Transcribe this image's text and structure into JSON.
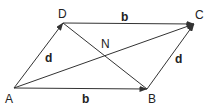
{
  "diagram": {
    "type": "parallelogram-vectors",
    "vertices": {
      "A": {
        "label": "A",
        "x": 14,
        "y": 88
      },
      "B": {
        "label": "B",
        "x": 147,
        "y": 89
      },
      "C": {
        "label": "C",
        "x": 194,
        "y": 24
      },
      "D": {
        "label": "D",
        "x": 63,
        "y": 23
      }
    },
    "intersection": {
      "label": "N"
    },
    "vectors": {
      "AB": {
        "label": "b"
      },
      "DC": {
        "label": "b"
      },
      "AD": {
        "label": "d"
      },
      "BC": {
        "label": "d"
      }
    },
    "diagonals": [
      "AC",
      "DB"
    ],
    "colors": {
      "line": "#333333",
      "text": "#222222",
      "background": "#ffffff"
    }
  }
}
